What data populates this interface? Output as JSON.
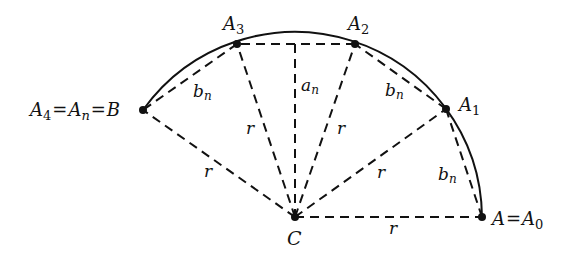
{
  "diagram": {
    "title": "",
    "center": {
      "label": "C",
      "x": 295,
      "y": 217
    },
    "radius": 186,
    "points": [
      {
        "id": "A0",
        "x": 482,
        "y": 217
      },
      {
        "id": "A1",
        "x": 446,
        "y": 109
      },
      {
        "id": "A2",
        "x": 355,
        "y": 44
      },
      {
        "id": "A3",
        "x": 237,
        "y": 44
      },
      {
        "id": "B",
        "x": 143,
        "y": 110
      }
    ],
    "labels": {
      "A0_main": "A",
      "A0_eq": "=",
      "A0_sym": "A",
      "A0_sub": "0",
      "A1_sym": "A",
      "A1_sub": "1",
      "A2_sym": "A",
      "A2_sub": "2",
      "A3_sym": "A",
      "A3_sub": "3",
      "B_a4_sym": "A",
      "B_a4_sub": "4",
      "B_eq1": "=",
      "B_an_sym": "A",
      "B_an_sub": "n",
      "B_eq2": "=",
      "B_main": "B",
      "C": "C",
      "an_sym": "a",
      "an_sub": "n",
      "bn_sym": "b",
      "bn_sub": "n",
      "r": "r"
    },
    "stroke_color": "#111111",
    "background": "#ffffff"
  }
}
